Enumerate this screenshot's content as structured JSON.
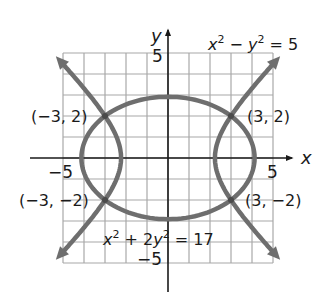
{
  "chart_data": {
    "type": "line",
    "title": "",
    "xlabel": "x",
    "ylabel": "y",
    "xlim": [
      -5,
      5
    ],
    "ylim": [
      -5,
      5
    ],
    "grid": true,
    "tick_labels": {
      "x_neg": "−5",
      "x_pos": "5",
      "y_pos": "5",
      "y_neg": "−5"
    },
    "series": [
      {
        "name": "x² − y² = 5",
        "kind": "hyperbola",
        "equation": "x^2 - y^2 = 5"
      },
      {
        "name": "x² + 2y² = 17",
        "kind": "ellipse",
        "equation": "x^2 + 2y^2 = 17"
      }
    ],
    "intersections": [
      {
        "x": -3,
        "y": 2,
        "label": "(−3, 2)"
      },
      {
        "x": 3,
        "y": 2,
        "label": "(3, 2)"
      },
      {
        "x": -3,
        "y": -2,
        "label": "(−3, −2)"
      },
      {
        "x": 3,
        "y": -2,
        "label": "(3, −2)"
      }
    ],
    "curve_color": "#6e6e6e",
    "grid_color": "#a8a8a8",
    "axis_color": "#1a1a1a"
  },
  "labels": {
    "x_axis": "x",
    "y_axis": "y",
    "x_neg5": "−5",
    "x_pos5": "5",
    "y_pos5": "5",
    "y_neg5": "−5",
    "hyperbola_eq_a": "x",
    "hyperbola_eq_b": "2",
    "hyperbola_eq_c": " − ",
    "hyperbola_eq_d": "y",
    "hyperbola_eq_e": "2",
    "hyperbola_eq_f": " = 5",
    "ellipse_eq_a": "x",
    "ellipse_eq_b": "2",
    "ellipse_eq_c": " + 2",
    "ellipse_eq_d": "y",
    "ellipse_eq_e": "2",
    "ellipse_eq_f": " = 17",
    "pt_tl": "(−3, 2)",
    "pt_tr": "(3, 2)",
    "pt_bl": "(−3, −2)",
    "pt_br": "(3, −2)"
  }
}
